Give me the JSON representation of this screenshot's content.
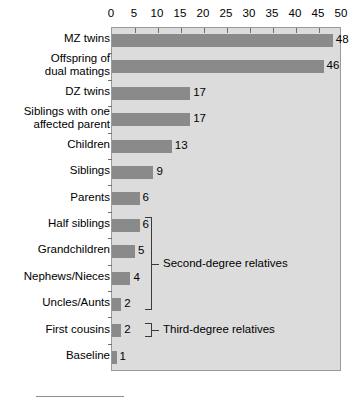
{
  "chart_data": {
    "type": "bar",
    "orientation": "horizontal",
    "title": "",
    "xlabel": "",
    "ylabel": "",
    "xlim": [
      0,
      50
    ],
    "xticks": [
      0,
      5,
      10,
      15,
      20,
      25,
      30,
      35,
      40,
      45,
      50
    ],
    "grid": false,
    "legend": null,
    "categories": [
      "MZ twins",
      "Offspring of dual matings",
      "DZ twins",
      "Siblings with one affected parent",
      "Children",
      "Siblings",
      "Parents",
      "Half siblings",
      "Grandchildren",
      "Nephews/Nieces",
      "Uncles/Aunts",
      "First cousins",
      "Baseline"
    ],
    "category_lines": [
      [
        "MZ twins"
      ],
      [
        "Offspring of",
        "dual matings"
      ],
      [
        "DZ twins"
      ],
      [
        "Siblings with one",
        "affected parent"
      ],
      [
        "Children"
      ],
      [
        "Siblings"
      ],
      [
        "Parents"
      ],
      [
        "Half siblings"
      ],
      [
        "Grandchildren"
      ],
      [
        "Nephews/Nieces"
      ],
      [
        "Uncles/Aunts"
      ],
      [
        "First cousins"
      ],
      [
        "Baseline"
      ]
    ],
    "values": [
      48,
      46,
      17,
      17,
      13,
      9,
      6,
      6,
      5,
      4,
      2,
      2,
      1
    ],
    "value_labels": [
      "48",
      "46",
      "17",
      "17",
      "13",
      "9",
      "6",
      "6",
      "5",
      "4",
      "2",
      "2",
      "1"
    ],
    "colors": {
      "bar": "#8a8a8a",
      "plot_background": "#dcdcdc",
      "plot_border": "#9a9a9a",
      "text": "#000000",
      "tick": "#6f6f6f",
      "bracket": "#3a3a3a",
      "page_background": "#ffffff"
    },
    "annotations": [
      {
        "text": "Second-degree relatives",
        "spans": [
          "Half siblings",
          "Grandchildren",
          "Nephews/Nieces",
          "Uncles/Aunts"
        ]
      },
      {
        "text": "Third-degree relatives",
        "spans": [
          "First cousins"
        ]
      }
    ]
  }
}
